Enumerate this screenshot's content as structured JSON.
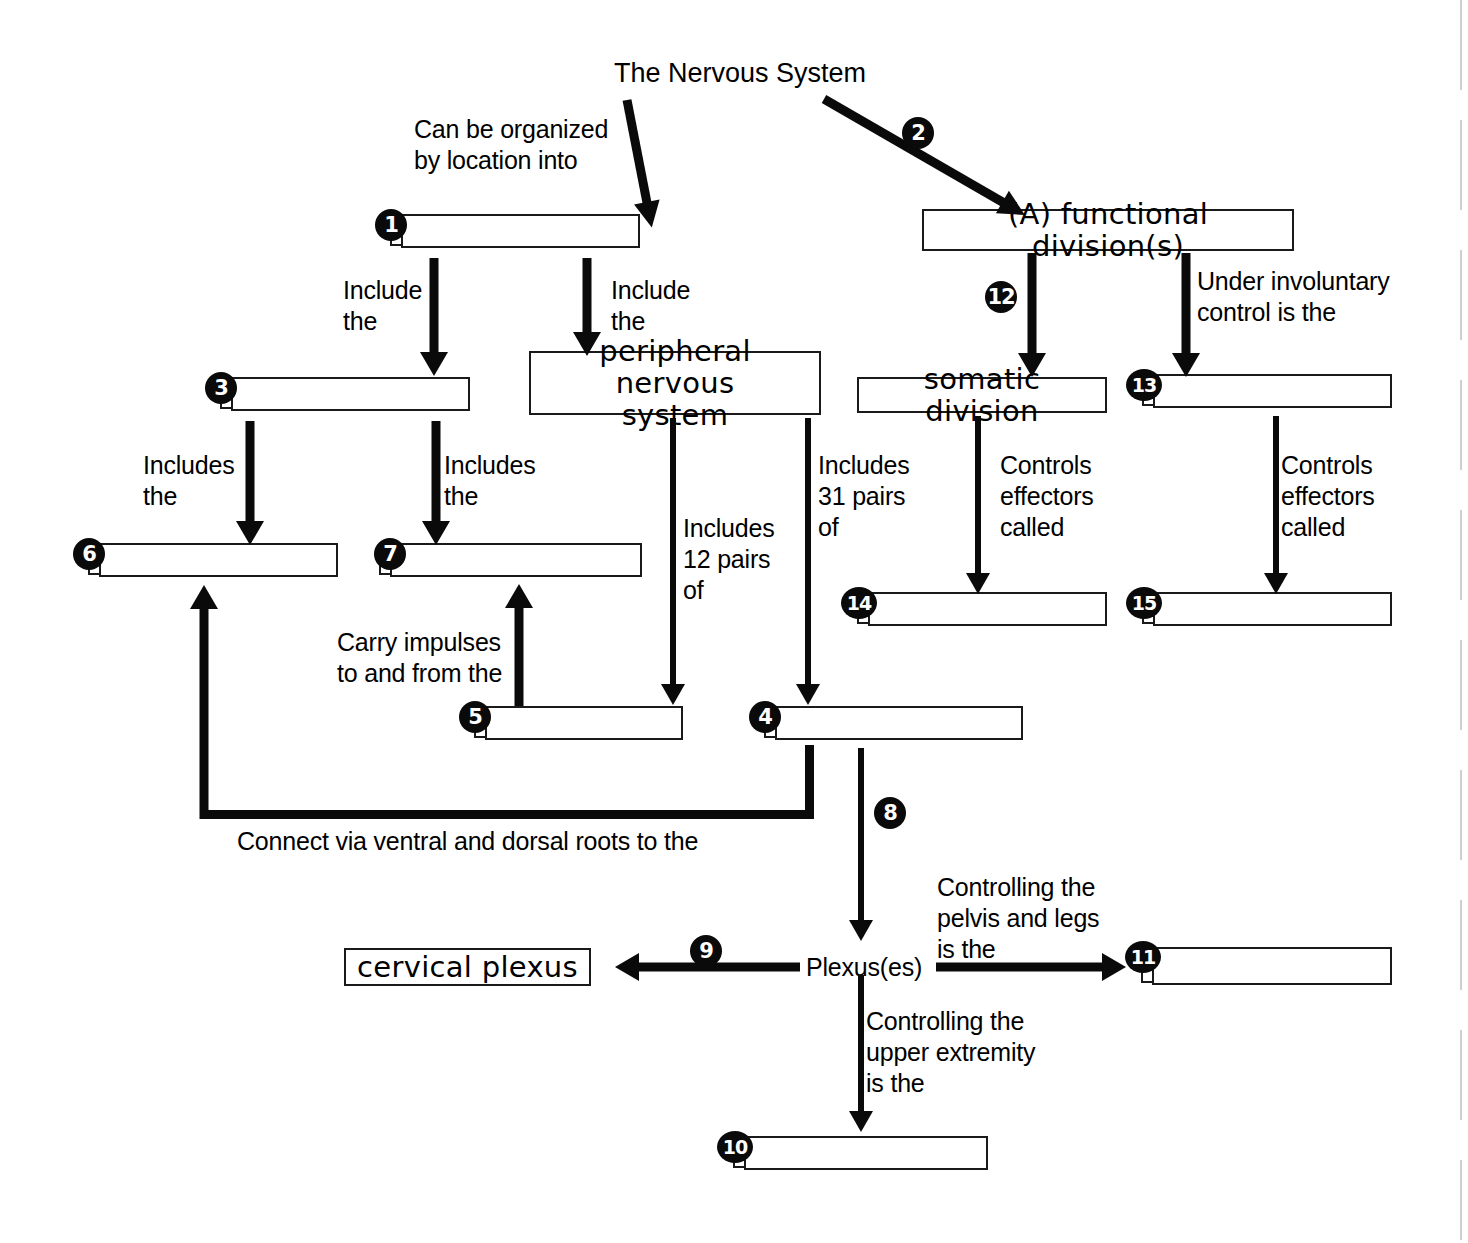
{
  "diagram": {
    "title": "The Nervous System",
    "title_color": "#000000",
    "connector_labels": {
      "organized_by_location": "Can be organized\nby location into",
      "include_the_left": "Include\nthe",
      "include_the_right": "Include\nthe",
      "includes_the_left": "Includes\nthe",
      "includes_the_right": "Includes\nthe",
      "includes_12_pairs": "Includes\n12 pairs\nof",
      "includes_31_pairs": "Includes\n31 pairs\nof",
      "controls_effectors_called_somatic": "Controls\neffectors\ncalled",
      "controls_effectors_called_autonomic": "Controls\neffectors\ncalled",
      "under_involuntary_control": "Under involuntary\ncontrol is the",
      "carry_impulses": "Carry impulses\nto and from the",
      "connect_via_roots": "Connect via ventral and dorsal roots to the",
      "controlling_pelvis_legs": "Controlling the\npelvis and legs\nis the",
      "controlling_upper_extremity": "Controlling the\nupper extremity\nis the",
      "plexuses": "Plexus(es)"
    },
    "filled_boxes": [
      {
        "id": "functional-divisions",
        "text": "(A) functional division(s)"
      },
      {
        "id": "peripheral-nervous-system",
        "text": "peripheral nervous\nsystem"
      },
      {
        "id": "somatic-division",
        "text": "somatic division"
      },
      {
        "id": "cervical-plexus",
        "text": "cervical plexus"
      }
    ],
    "blank_boxes": [
      {
        "id": "blank-1",
        "number": "1",
        "answer": ""
      },
      {
        "id": "blank-3",
        "number": "3",
        "answer": ""
      },
      {
        "id": "blank-4",
        "number": "4",
        "answer": ""
      },
      {
        "id": "blank-5",
        "number": "5",
        "answer": ""
      },
      {
        "id": "blank-6",
        "number": "6",
        "answer": ""
      },
      {
        "id": "blank-7",
        "number": "7",
        "answer": ""
      },
      {
        "id": "blank-10",
        "number": "10",
        "answer": ""
      },
      {
        "id": "blank-11",
        "number": "11",
        "answer": ""
      },
      {
        "id": "blank-13",
        "number": "13",
        "answer": ""
      },
      {
        "id": "blank-14",
        "number": "14",
        "answer": ""
      },
      {
        "id": "blank-15",
        "number": "15",
        "answer": ""
      }
    ],
    "arrow_numbers": [
      {
        "id": "arrow-num-2",
        "number": "2"
      },
      {
        "id": "arrow-num-8",
        "number": "8"
      },
      {
        "id": "arrow-num-9",
        "number": "9"
      },
      {
        "id": "arrow-num-12",
        "number": "12"
      }
    ]
  }
}
